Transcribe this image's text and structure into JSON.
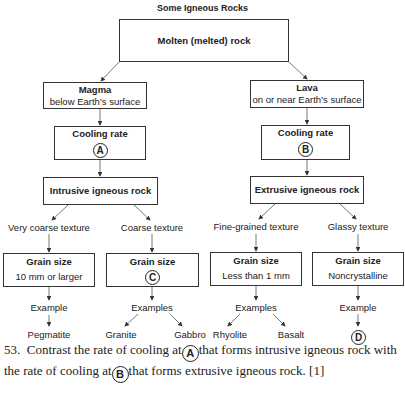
{
  "diagram": {
    "title": "Some Igneous Rocks",
    "root": {
      "label": "Molten (melted) rock"
    },
    "magma": {
      "title": "Magma",
      "subtitle": "below Earth’s surface"
    },
    "lava": {
      "title": "Lava",
      "subtitle": "on or near Earth’s surface"
    },
    "cooling_a": {
      "title": "Cooling rate",
      "marker": "A"
    },
    "cooling_b": {
      "title": "Cooling rate",
      "marker": "B"
    },
    "intrusive": {
      "label": "Intrusive igneous rock"
    },
    "extrusive": {
      "label": "Extrusive igneous rock"
    },
    "textures": [
      {
        "label": "Very coarse texture",
        "grain_title": "Grain size",
        "grain_value": "10 mm or larger",
        "examples_label": "Example",
        "examples": [
          "Pegmatite"
        ]
      },
      {
        "label": "Coarse texture",
        "grain_title": "Grain size",
        "grain_marker": "C",
        "examples_label": "Examples",
        "examples": [
          "Granite",
          "Gabbro"
        ]
      },
      {
        "label": "Fine-grained texture",
        "grain_title": "Grain size",
        "grain_value": "Less than 1 mm",
        "examples_label": "Examples",
        "examples": [
          "Rhyolite",
          "Basalt"
        ]
      },
      {
        "label": "Glassy texture",
        "grain_title": "Grain size",
        "grain_value": "Noncrystalline",
        "examples_label": "Example",
        "example_marker": "D"
      }
    ]
  },
  "question": {
    "number": "53.",
    "part1": "Contrast the rate of cooling at",
    "marker_a": "A",
    "part2": "that forms intrusive igneous rock with the rate of cooling at",
    "marker_b": "B",
    "part3": "that forms extrusive igneous rock. [1]"
  }
}
